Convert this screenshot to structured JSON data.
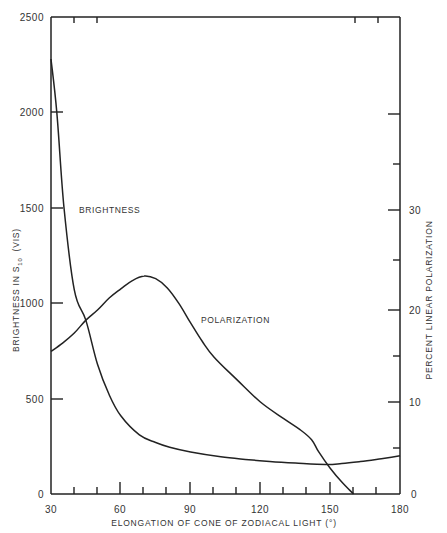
{
  "chart_data": {
    "type": "line",
    "title": "",
    "xlabel": "ELONGATION OF CONE OF ZODIACAL LIGHT (°)",
    "ylabel_left": {
      "main": "BRIGHTNESS IN S",
      "sub": "10",
      "suffix": "(VIS)"
    },
    "ylabel_right": "PERCENT LINEAR POLARIZATION",
    "xlim": [
      30,
      180
    ],
    "ylim_left": [
      0,
      2500
    ],
    "ylim_right": [
      0,
      40
    ],
    "x_ticks": [
      30,
      60,
      90,
      120,
      150,
      180
    ],
    "x_tick_labels": [
      "30",
      "60",
      "90",
      "120",
      "150",
      "180"
    ],
    "y_left_ticks": [
      0,
      500,
      1000,
      1500,
      2000,
      2500
    ],
    "y_left_tick_labels": [
      "0",
      "500",
      "1000",
      "1500",
      "2000",
      "2500"
    ],
    "y_right_ticks": [
      0,
      10,
      20,
      30,
      40
    ],
    "y_right_tick_labels": [
      "0",
      "10",
      "20",
      "30",
      ""
    ],
    "grid": false,
    "legend": "inline labels",
    "series": [
      {
        "name": "BRIGHTNESS",
        "axis": "left",
        "x": [
          30,
          32.5,
          35.6,
          40,
          45,
          50,
          55,
          60,
          68,
          75,
          81,
          90,
          103,
          115,
          124,
          135,
          148,
          155,
          163,
          172,
          180
        ],
        "values": [
          2280,
          2000,
          1500,
          1070,
          910,
          680,
          520,
          410,
          310,
          270,
          245,
          220,
          195,
          180,
          170,
          162,
          155,
          160,
          170,
          185,
          200
        ]
      },
      {
        "name": "POLARIZATION",
        "axis": "right",
        "x": [
          30,
          35,
          40,
          45,
          50,
          55,
          60,
          65,
          70,
          75,
          80,
          85,
          90,
          95,
          100,
          110,
          120,
          130,
          137,
          142,
          145,
          150,
          155,
          160
        ],
        "values": [
          15.5,
          16.4,
          17.5,
          18.9,
          20.0,
          21.3,
          22.3,
          23.2,
          23.7,
          23.4,
          22.4,
          20.7,
          18.6,
          16.6,
          14.9,
          12.4,
          10.0,
          8.2,
          7.0,
          5.9,
          4.6,
          2.8,
          1.3,
          0
        ]
      }
    ],
    "annotations": [
      {
        "text": "BRIGHTNESS",
        "x": 37,
        "y_left": 1580
      },
      {
        "text": "POLARIZATION",
        "x": 98,
        "y_left": 1035
      }
    ]
  },
  "labels": {
    "brightness": "BRIGHTNESS",
    "polarization": "POLARIZATION",
    "xlabel": "ELONGATION OF CONE OF ZODIACAL LIGHT (°)",
    "ylabel_left_main": "BRIGHTNESS   IN  S",
    "ylabel_left_sub": "10",
    "ylabel_left_suffix": "(VIS)",
    "ylabel_right": "PERCENT LINEAR POLARIZATION",
    "x_ticks": [
      "30",
      "60",
      "90",
      "120",
      "150",
      "180"
    ],
    "y_left_ticks": [
      "2500",
      "2000",
      "1500",
      "1000",
      "500",
      "0"
    ],
    "y_right_ticks": [
      "30",
      "20",
      "10",
      "0"
    ]
  }
}
